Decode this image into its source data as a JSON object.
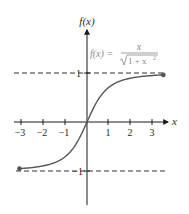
{
  "chart_data": {
    "type": "line",
    "title": "",
    "xlabel": "x",
    "ylabel": "f(x)",
    "annotation": "f(x) = x / √(1 + x²)",
    "formula_parts": {
      "lhs": "f(x) =",
      "numerator": "x",
      "denominator": "1 + x"
    },
    "xlim": [
      -3,
      3.5
    ],
    "ylim": [
      -1.8,
      1.9
    ],
    "x_ticks": [
      -3,
      -2,
      -1,
      1,
      2,
      3
    ],
    "x_tick_labels": [
      "−3",
      "−2",
      "−1",
      "1",
      "2",
      "3"
    ],
    "y_tick_labels": [
      "1",
      "−1"
    ],
    "asymptotes": [
      1,
      -1
    ],
    "grid": false,
    "legend": "none",
    "series": [
      {
        "name": "f(x) = x/sqrt(1+x^2)",
        "x": [
          -3,
          -2.5,
          -2,
          -1.5,
          -1,
          -0.5,
          0,
          0.5,
          1,
          1.5,
          2,
          2.5,
          3,
          3.5
        ],
        "values": [
          -0.949,
          -0.928,
          -0.894,
          -0.832,
          -0.707,
          -0.447,
          0,
          0.447,
          0.707,
          0.832,
          0.894,
          0.928,
          0.949,
          0.962
        ]
      }
    ]
  },
  "colors": {
    "axis": "#1a1a1a",
    "curve": "#555555",
    "dash": "#333333",
    "formula": "#8a8a8a"
  }
}
